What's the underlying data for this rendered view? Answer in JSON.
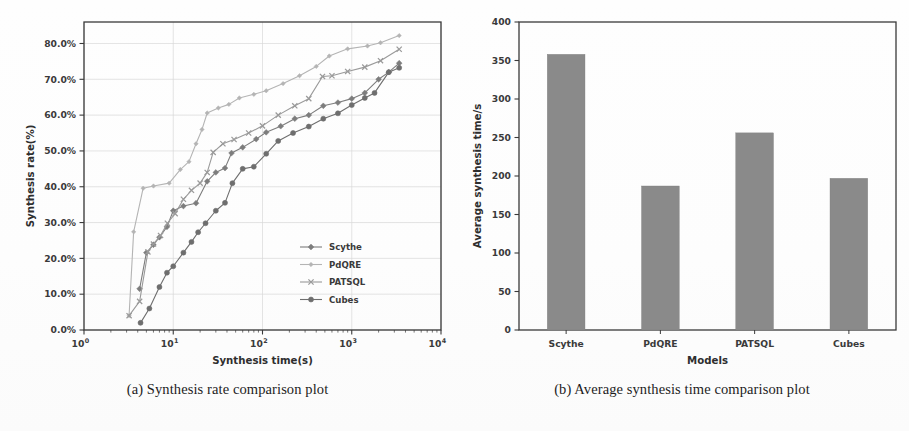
{
  "figure": {
    "background": "#ffffff",
    "ink": "#3a3a3a"
  },
  "captions": {
    "a": "(a) Synthesis rate comparison plot",
    "b": "(b) Average synthesis time comparison plot"
  },
  "chart_data": [
    {
      "id": "synthesis-rate",
      "type": "line",
      "title": "",
      "xlabel": "Synthesis time(s)",
      "ylabel": "Synthesis rate(%)",
      "xscale": "log",
      "xlim": [
        1,
        10000
      ],
      "ylim": [
        0,
        0.86
      ],
      "grid": true,
      "legend_position": "lower right",
      "xticks": [
        "10^0",
        "10^1",
        "10^2",
        "10^3",
        "10^4"
      ],
      "xtick_labels": [
        "10",
        "10",
        "10",
        "10",
        "10"
      ],
      "xtick_exponents": [
        "0",
        "1",
        "2",
        "3",
        "4"
      ],
      "ytick_labels": [
        "0.0%",
        "10.0%",
        "20.0%",
        "30.0%",
        "40.0%",
        "50.0%",
        "60.0%",
        "70.0%",
        "80.0%"
      ],
      "ytick_values": [
        0,
        10,
        20,
        30,
        40,
        50,
        60,
        70,
        80
      ],
      "series": [
        {
          "name": "Scythe",
          "marker": "diamond",
          "color": "#7d7d7d",
          "points": [
            [
              4.2,
              11.5
            ],
            [
              5.0,
              21.6
            ],
            [
              6.0,
              23.8
            ],
            [
              7.0,
              25.9
            ],
            [
              8.5,
              28.8
            ],
            [
              10.0,
              33.3
            ],
            [
              13.0,
              34.6
            ],
            [
              18.0,
              35.4
            ],
            [
              24.0,
              41.5
            ],
            [
              30.0,
              44.0
            ],
            [
              38.0,
              45.2
            ],
            [
              45.0,
              49.4
            ],
            [
              60.0,
              51.0
            ],
            [
              85.0,
              53.3
            ],
            [
              110.0,
              55.2
            ],
            [
              160.0,
              56.9
            ],
            [
              230.0,
              59.0
            ],
            [
              330.0,
              60.0
            ],
            [
              480.0,
              62.6
            ],
            [
              700.0,
              63.5
            ],
            [
              1000.0,
              64.6
            ],
            [
              1400.0,
              66.2
            ],
            [
              2000.0,
              70.0
            ],
            [
              2600.0,
              72.0
            ],
            [
              3400.0,
              74.5
            ]
          ]
        },
        {
          "name": "PdQRE",
          "marker": "diamond-small",
          "color": "#b4b4b4",
          "points": [
            [
              3.2,
              4.0
            ],
            [
              3.6,
              27.4
            ],
            [
              4.6,
              39.6
            ],
            [
              6.0,
              40.2
            ],
            [
              9.0,
              41.0
            ],
            [
              12.0,
              44.8
            ],
            [
              15.0,
              47.0
            ],
            [
              18.0,
              52.0
            ],
            [
              21.0,
              56.0
            ],
            [
              24.0,
              60.6
            ],
            [
              32.0,
              62.0
            ],
            [
              42.0,
              63.0
            ],
            [
              55.0,
              64.8
            ],
            [
              80.0,
              65.8
            ],
            [
              110.0,
              66.8
            ],
            [
              170.0,
              68.8
            ],
            [
              260.0,
              71.0
            ],
            [
              400.0,
              73.6
            ],
            [
              560.0,
              76.5
            ],
            [
              900.0,
              78.5
            ],
            [
              1500.0,
              79.3
            ],
            [
              2100.0,
              80.2
            ],
            [
              3400.0,
              82.2
            ]
          ]
        },
        {
          "name": "PATSQL",
          "marker": "x",
          "color": "#9a9a9a",
          "points": [
            [
              3.2,
              4.0
            ],
            [
              4.2,
              8.0
            ],
            [
              5.2,
              21.8
            ],
            [
              6.0,
              24.0
            ],
            [
              7.2,
              26.4
            ],
            [
              8.6,
              29.8
            ],
            [
              10.5,
              32.5
            ],
            [
              13.0,
              36.5
            ],
            [
              16.0,
              39.0
            ],
            [
              20.0,
              41.0
            ],
            [
              24.0,
              44.0
            ],
            [
              28.0,
              49.6
            ],
            [
              36.0,
              52.0
            ],
            [
              48.0,
              53.2
            ],
            [
              70.0,
              55.0
            ],
            [
              100.0,
              57.0
            ],
            [
              150.0,
              60.0
            ],
            [
              230.0,
              62.6
            ],
            [
              330.0,
              64.6
            ],
            [
              470.0,
              70.8
            ],
            [
              600.0,
              71.0
            ],
            [
              900.0,
              72.2
            ],
            [
              1400.0,
              73.4
            ],
            [
              2100.0,
              75.2
            ],
            [
              3400.0,
              78.4
            ]
          ]
        },
        {
          "name": "Cubes",
          "marker": "circle",
          "color": "#6e6e6e",
          "points": [
            [
              4.3,
              2.0
            ],
            [
              5.4,
              6.0
            ],
            [
              7.0,
              12.0
            ],
            [
              8.5,
              16.0
            ],
            [
              10.0,
              17.8
            ],
            [
              13.0,
              21.6
            ],
            [
              16.0,
              24.6
            ],
            [
              19.0,
              27.3
            ],
            [
              23.0,
              29.8
            ],
            [
              30.0,
              33.3
            ],
            [
              38.0,
              35.5
            ],
            [
              46.0,
              41.0
            ],
            [
              60.0,
              45.0
            ],
            [
              80.0,
              45.6
            ],
            [
              110.0,
              49.2
            ],
            [
              150.0,
              52.8
            ],
            [
              220.0,
              55.0
            ],
            [
              330.0,
              56.8
            ],
            [
              480.0,
              59.0
            ],
            [
              700.0,
              60.5
            ],
            [
              1000.0,
              62.8
            ],
            [
              1400.0,
              64.8
            ],
            [
              1800.0,
              66.2
            ],
            [
              2600.0,
              72.0
            ],
            [
              3400.0,
              73.2
            ]
          ]
        }
      ]
    },
    {
      "id": "average-synthesis-time",
      "type": "bar",
      "title": "",
      "xlabel": "Models",
      "ylabel": "Average synthesis time/s",
      "categories": [
        "Scythe",
        "PdQRE",
        "PATSQL",
        "Cubes"
      ],
      "values": [
        358,
        187,
        256,
        197
      ],
      "ylim": [
        0,
        400
      ],
      "ytick_values": [
        0,
        50,
        100,
        150,
        200,
        250,
        300,
        350,
        400
      ],
      "ytick_labels": [
        "0",
        "50",
        "100",
        "150",
        "200",
        "250",
        "300",
        "350",
        "400"
      ],
      "bar_color": "#8a8a8a",
      "grid": false
    }
  ]
}
